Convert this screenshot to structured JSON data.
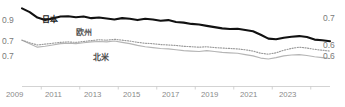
{
  "chart_data": {
    "type": "line",
    "title": "",
    "xlabel": "",
    "ylabel": "",
    "grid": false,
    "legend_position": "inline-annotations",
    "x_tick_labels": [
      "2009",
      "2011",
      "2013",
      "2015",
      "2017",
      "2019",
      "2021",
      "2023"
    ],
    "x_range": [
      2008.0,
      2024.0
    ],
    "axes": {
      "left": {
        "labels": [
          "0.9",
          "0.7",
          "0.7"
        ],
        "values": [
          0.9,
          0.7,
          0.7
        ],
        "note": "two stacked left scales: upper axis for 日本, lower axis for 欧州/北米"
      },
      "right": {
        "labels": [
          "0.7",
          "0.6",
          "0.6"
        ],
        "values": [
          0.7,
          0.6,
          0.6
        ],
        "note": "two stacked right scales: upper axis for 日本, lower axis for 欧州/北米"
      }
    },
    "series": [
      {
        "name": "日本",
        "style": "solid-thick-black",
        "color": "#111111",
        "axis": "upper",
        "ylim": [
          0.7,
          0.9
        ],
        "x": [
          2008.0,
          2008.4,
          2008.8,
          2009.2,
          2009.6,
          2010.0,
          2010.4,
          2010.8,
          2011.2,
          2011.6,
          2012.0,
          2012.4,
          2012.8,
          2013.2,
          2013.6,
          2014.0,
          2014.4,
          2014.8,
          2015.2,
          2015.6,
          2016.0,
          2016.4,
          2016.8,
          2017.2,
          2017.6,
          2018.0,
          2018.4,
          2018.8,
          2019.2,
          2019.6,
          2020.0,
          2020.4,
          2020.8,
          2021.2,
          2021.6,
          2022.0,
          2022.4,
          2022.8,
          2023.2,
          2023.6,
          2024.0
        ],
        "values": [
          0.935,
          0.912,
          0.878,
          0.862,
          0.872,
          0.884,
          0.886,
          0.88,
          0.884,
          0.874,
          0.878,
          0.872,
          0.866,
          0.874,
          0.87,
          0.862,
          0.87,
          0.866,
          0.858,
          0.862,
          0.85,
          0.846,
          0.838,
          0.834,
          0.826,
          0.818,
          0.81,
          0.806,
          0.808,
          0.8,
          0.792,
          0.77,
          0.746,
          0.742,
          0.752,
          0.758,
          0.762,
          0.756,
          0.74,
          0.736,
          0.73
        ]
      },
      {
        "name": "欧州",
        "style": "dotted-gray",
        "color": "#9a9a9a",
        "axis": "lower",
        "ylim": [
          0.6,
          0.7
        ],
        "x": [
          2008.0,
          2008.4,
          2008.8,
          2009.2,
          2009.6,
          2010.0,
          2010.4,
          2010.8,
          2011.2,
          2011.6,
          2012.0,
          2012.4,
          2012.8,
          2013.2,
          2013.6,
          2014.0,
          2014.4,
          2014.8,
          2015.2,
          2015.6,
          2016.0,
          2016.4,
          2016.8,
          2017.2,
          2017.6,
          2018.0,
          2018.4,
          2018.8,
          2019.2,
          2019.6,
          2020.0,
          2020.4,
          2020.8,
          2021.2,
          2021.6,
          2022.0,
          2022.4,
          2022.8,
          2023.2,
          2023.6,
          2024.0
        ],
        "values": [
          0.7,
          0.688,
          0.678,
          0.682,
          0.686,
          0.69,
          0.692,
          0.69,
          0.694,
          0.698,
          0.702,
          0.7,
          0.704,
          0.7,
          0.696,
          0.69,
          0.686,
          0.684,
          0.68,
          0.678,
          0.676,
          0.672,
          0.67,
          0.668,
          0.67,
          0.666,
          0.664,
          0.662,
          0.66,
          0.656,
          0.65,
          0.64,
          0.636,
          0.642,
          0.654,
          0.662,
          0.668,
          0.664,
          0.658,
          0.654,
          0.65
        ]
      },
      {
        "name": "北米",
        "style": "solid-light-gray",
        "color": "#b5b5b5",
        "axis": "lower",
        "ylim": [
          0.6,
          0.7
        ],
        "x": [
          2008.0,
          2008.4,
          2008.8,
          2009.2,
          2009.6,
          2010.0,
          2010.4,
          2010.8,
          2011.2,
          2011.6,
          2012.0,
          2012.4,
          2012.8,
          2013.2,
          2013.6,
          2014.0,
          2014.4,
          2014.8,
          2015.2,
          2015.6,
          2016.0,
          2016.4,
          2016.8,
          2017.2,
          2017.6,
          2018.0,
          2018.4,
          2018.8,
          2019.2,
          2019.6,
          2020.0,
          2020.4,
          2020.8,
          2021.2,
          2021.6,
          2022.0,
          2022.4,
          2022.8,
          2023.2,
          2023.6,
          2024.0
        ],
        "values": [
          0.7,
          0.684,
          0.668,
          0.672,
          0.678,
          0.684,
          0.686,
          0.684,
          0.688,
          0.692,
          0.694,
          0.692,
          0.696,
          0.69,
          0.684,
          0.676,
          0.67,
          0.666,
          0.662,
          0.66,
          0.656,
          0.652,
          0.65,
          0.648,
          0.652,
          0.648,
          0.644,
          0.642,
          0.64,
          0.634,
          0.628,
          0.618,
          0.614,
          0.62,
          0.628,
          0.632,
          0.634,
          0.63,
          0.624,
          0.62,
          0.616
        ]
      }
    ],
    "annotations": [
      {
        "text": "日本",
        "series": "日本"
      },
      {
        "text": "欧州",
        "series": "欧州"
      },
      {
        "text": "北米",
        "series": "北米"
      }
    ]
  },
  "axis": {
    "left": {
      "l0": "0.9",
      "l1": "0.7",
      "l2": "0.7"
    },
    "right": {
      "r0": "0.7",
      "r1": "0.6",
      "r2": "0.6"
    }
  },
  "ticks": {
    "t0": "2009",
    "t1": "2011",
    "t2": "2013",
    "t3": "2015",
    "t4": "2017",
    "t5": "2019",
    "t6": "2021",
    "t7": "2023"
  },
  "labels": {
    "japan": "日本",
    "europe": "欧州",
    "north_america": "北米"
  },
  "clipped_title": "",
  "colors": {
    "japan": "#111111",
    "europe": "#9a9a9a",
    "north_america": "#b5b5b5",
    "axis_text": "#7a7a7a",
    "tick_text": "#8a8a8a",
    "axis_line": "#c8c8c8",
    "background": "#ffffff"
  }
}
